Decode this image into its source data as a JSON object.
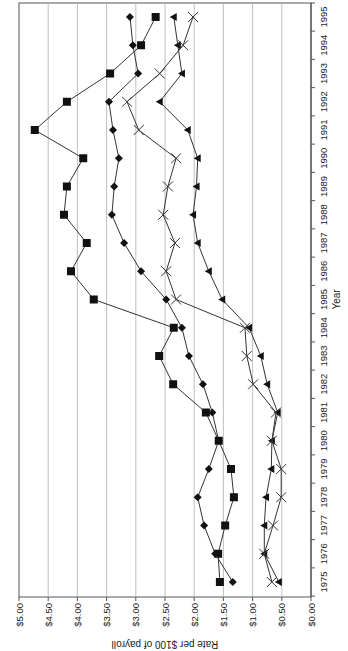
{
  "chart_data": {
    "type": "line",
    "orientation": "rotated-90-clockwise",
    "title": "",
    "xlabel": "Year",
    "ylabel": "Rate per $100 of payroll",
    "x": [
      1975,
      1976,
      1977,
      1978,
      1979,
      1980,
      1981,
      1982,
      1983,
      1984,
      1985,
      1986,
      1987,
      1988,
      1989,
      1990,
      1991,
      1992,
      1993,
      1994,
      1995
    ],
    "x_tick_labels": [
      "1975",
      "1976",
      "1977",
      "1978",
      "1979",
      "1980",
      "1981",
      "1982",
      "1983",
      "1984",
      "1985",
      "1986",
      "1987",
      "1988",
      "1989",
      "1990",
      "1991",
      "1992",
      "1993",
      "1994",
      "1995"
    ],
    "y_tick_labels": [
      "$0.00",
      "$0.50",
      "$1.00",
      "$1.50",
      "$2.00",
      "$2.50",
      "$3.00",
      "$3.50",
      "$4.00",
      "$4.50",
      "$5.00"
    ],
    "y_ticks": [
      0,
      0.5,
      1.0,
      1.5,
      2.0,
      2.5,
      3.0,
      3.5,
      4.0,
      4.5,
      5.0
    ],
    "ylim": [
      0,
      5
    ],
    "grid": true,
    "legend": null,
    "series": [
      {
        "name": "Series 1 (square markers)",
        "marker": "square",
        "values": [
          1.56,
          1.59,
          1.47,
          1.32,
          1.37,
          1.58,
          1.8,
          2.36,
          2.6,
          2.35,
          3.72,
          4.11,
          3.84,
          4.23,
          4.18,
          3.9,
          4.73,
          4.18,
          3.44,
          2.91,
          2.66
        ]
      },
      {
        "name": "Series 2 (diamond markers)",
        "marker": "diamond",
        "values": [
          1.34,
          1.64,
          1.83,
          1.94,
          1.75,
          1.58,
          1.69,
          1.85,
          2.09,
          2.21,
          2.48,
          2.91,
          3.2,
          3.41,
          3.37,
          3.29,
          3.39,
          3.46,
          2.96,
          3.05,
          3.1
        ]
      },
      {
        "name": "Series 3 (triangle markers)",
        "marker": "triangle",
        "values": [
          0.55,
          0.8,
          0.8,
          0.77,
          0.68,
          0.67,
          0.57,
          0.75,
          0.86,
          1.06,
          1.52,
          1.75,
          1.94,
          2.02,
          1.96,
          1.94,
          2.11,
          2.59,
          2.21,
          2.28,
          2.35
        ]
      },
      {
        "name": "Series 4 (x markers)",
        "marker": "x",
        "values": [
          0.67,
          0.8,
          0.65,
          0.51,
          0.51,
          0.67,
          0.6,
          0.99,
          1.1,
          1.13,
          2.31,
          2.48,
          2.33,
          2.53,
          2.45,
          2.31,
          2.95,
          3.15,
          2.59,
          2.19,
          2.02
        ]
      }
    ]
  },
  "layout": {
    "plot_left": 19,
    "plot_right": 311,
    "plot_top": 3,
    "plot_bottom": 597,
    "year_first_y": 582,
    "year_step": 28.25,
    "line_color": "#333333",
    "marker_color": "#111111",
    "grid_color": "#b0b0b0",
    "axis_color": "#555555"
  }
}
